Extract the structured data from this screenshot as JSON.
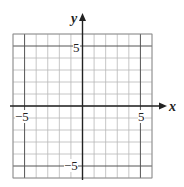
{
  "chart_data": {
    "type": "grid",
    "title": "",
    "xlabel": "x",
    "ylabel": "y",
    "xlim": [
      -6,
      6
    ],
    "ylim": [
      -6,
      6
    ],
    "grid": true,
    "grid_step": 1,
    "emphasized_lines": [
      -5,
      5
    ],
    "tick_labels": {
      "x": [
        "-5",
        "5"
      ],
      "y": [
        "5",
        "-5"
      ]
    },
    "series": []
  },
  "labels": {
    "x_axis": "x",
    "y_axis": "y",
    "x_neg": "−5",
    "x_pos": "5",
    "y_pos": "5",
    "y_neg": "−5"
  }
}
